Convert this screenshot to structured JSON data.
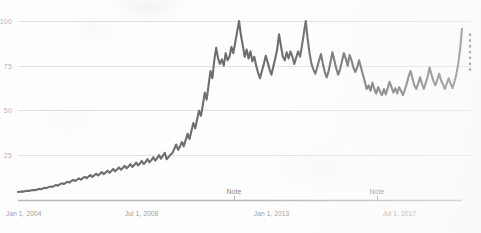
{
  "chart_data": {
    "type": "line",
    "title": "",
    "subtitle": "",
    "xlabel": "",
    "ylabel": "",
    "grid": true,
    "grid_axis": "y",
    "legend": "none",
    "line_color": "#6e6e6e",
    "grid_color": "#e2e2e2",
    "axis_color": "#b8b8b8",
    "background_color": "#fefefe",
    "ylim": [
      0,
      105
    ],
    "y_ticks": [
      25,
      50,
      75,
      100
    ],
    "y_tick_labels": [
      "25",
      "50",
      "75",
      "100"
    ],
    "x_ticks": [
      0,
      54,
      108,
      162
    ],
    "x_tick_labels": [
      "Jan 1, 2004",
      "Jul 1, 2008",
      "Jan 1, 2013",
      "Jul 1, 2017"
    ],
    "x_range_months": [
      0,
      186
    ],
    "annotations": [
      {
        "label": "Note",
        "x_month": 94,
        "x_px": 234
      },
      {
        "label": "Note",
        "x_month": 151,
        "x_px": 377
      }
    ],
    "series": [
      {
        "name": "value",
        "style": "solid",
        "values": [
          4.5,
          4.6,
          4.8,
          4.7,
          5.0,
          5.2,
          5.1,
          5.4,
          5.6,
          5.5,
          5.9,
          6.2,
          6.0,
          6.4,
          6.8,
          6.6,
          7.2,
          7.6,
          7.3,
          7.9,
          8.4,
          8.0,
          8.8,
          9.3,
          8.9,
          9.6,
          10.2,
          9.7,
          10.6,
          11.2,
          10.6,
          11.4,
          12.1,
          11.3,
          12.2,
          13.0,
          12.2,
          13.1,
          13.9,
          12.9,
          13.8,
          14.7,
          13.7,
          14.6,
          15.6,
          14.4,
          15.4,
          16.4,
          15.2,
          16.2,
          17.3,
          16.0,
          17.0,
          18.2,
          16.9,
          17.9,
          19.1,
          17.7,
          18.7,
          20.0,
          18.5,
          19.5,
          20.9,
          19.3,
          20.4,
          21.8,
          20.1,
          21.3,
          22.8,
          21.0,
          22.3,
          23.9,
          22.0,
          23.4,
          25.1,
          23.1,
          24.6,
          26.4,
          22.8,
          24.0,
          25.4,
          26.2,
          28.5,
          31.0,
          28.0,
          29.8,
          32.4,
          30.0,
          33.6,
          37.0,
          34.0,
          38.5,
          43.0,
          40.0,
          45.0,
          50.0,
          47.0,
          53.0,
          60.0,
          56.0,
          64.0,
          72.0,
          68.0,
          78.0,
          85.0,
          79.0,
          76.0,
          78.5,
          75.0,
          82.0,
          78.0,
          80.0,
          85.5,
          82.0,
          88.0,
          94.0,
          100.0,
          92.0,
          86.0,
          80.0,
          84.0,
          79.0,
          83.0,
          77.5,
          80.0,
          75.0,
          71.0,
          68.0,
          72.0,
          76.0,
          80.5,
          77.0,
          73.0,
          70.0,
          74.5,
          79.0,
          84.0,
          92.5,
          86.0,
          80.0,
          78.0,
          82.5,
          79.0,
          83.0,
          80.0,
          76.0,
          79.5,
          83.0,
          80.0,
          86.0,
          93.0,
          100.0,
          90.0,
          82.0,
          76.0,
          73.0,
          70.5,
          74.0,
          78.0,
          81.5,
          76.0,
          71.5,
          68.5,
          72.0,
          77.0,
          82.5,
          78.0,
          73.5,
          70.0,
          73.0,
          77.5,
          82.0,
          79.0,
          75.0,
          81.0,
          78.0,
          74.0,
          71.5,
          74.0,
          78.0,
          74.0,
          70.0,
          66.0,
          62.0,
          64.0,
          61.0,
          65.5,
          62.0,
          59.5,
          63.0,
          60.5,
          58.5,
          62.0,
          59.0,
          62.5,
          66.0,
          63.0,
          60.0,
          62.5,
          59.5,
          63.0,
          61.0,
          58.5,
          61.5,
          65.0,
          69.0,
          72.0,
          68.0,
          64.0,
          62.0,
          65.0,
          68.5,
          65.0,
          62.0,
          65.5,
          69.0,
          74.0,
          70.0,
          66.5,
          64.0,
          67.0,
          70.5,
          67.0,
          64.5,
          62.0,
          65.0,
          68.0,
          65.0,
          62.5,
          66.0,
          70.0,
          76.0,
          84.0,
          95.5
        ]
      },
      {
        "name": "forecast",
        "style": "dashed",
        "note": "short dashed vertical segment at the right edge",
        "x_px": 470,
        "y_top_value": 93.0,
        "y_bottom_value": 72.0
      }
    ]
  },
  "axes": {
    "y_axis_name": "value-axis",
    "x_axis_name": "time-axis"
  }
}
